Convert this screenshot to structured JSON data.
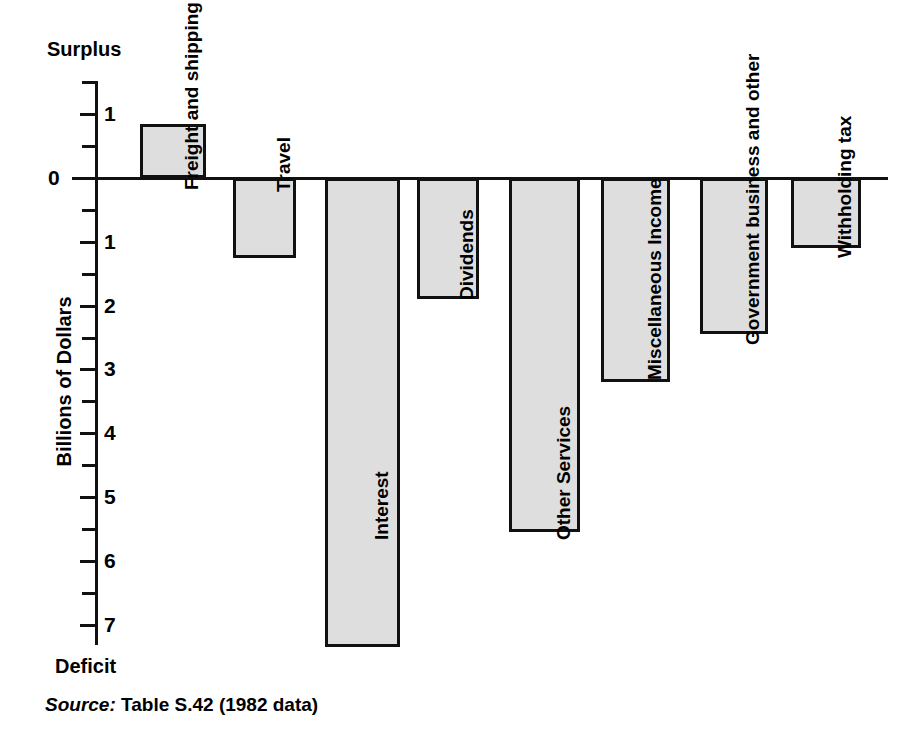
{
  "chart_data": {
    "type": "bar",
    "title": "",
    "xlabel": "",
    "ylabel": "Billions of Dollars",
    "ylim": [
      -7.5,
      1.5
    ],
    "grid": false,
    "legend": null,
    "orientation": "vertical",
    "top_axis_annotation": "Surplus",
    "bottom_axis_annotation": "Deficit",
    "categories": [
      "Freight and shipping",
      "Travel",
      "Interest",
      "Dividends",
      "Other Services",
      "Miscellaneous Income",
      "Government business and other",
      "Withholding tax"
    ],
    "values": [
      0.85,
      -1.25,
      -7.35,
      -1.9,
      -5.55,
      -3.2,
      -2.45,
      -1.1
    ],
    "ytick_values": [
      1,
      0,
      -1,
      -2,
      -3,
      -4,
      -5,
      -6,
      -7
    ],
    "ytick_labels": [
      "1",
      "0",
      "1",
      "2",
      "3",
      "4",
      "5",
      "6",
      "7"
    ],
    "minor_tick_values": [
      1.5,
      0.5,
      -0.5,
      -1.5,
      -2.5,
      -3.5,
      -4.5,
      -5.5,
      -6.5
    ],
    "source": {
      "keyword": "Source:",
      "text": "Table S.42 (1982 data)"
    },
    "colors": {
      "bar_fill": "#dedede",
      "bar_stroke": "#111111",
      "axis": "#111111",
      "background": "#ffffff",
      "text": "#000000"
    }
  }
}
